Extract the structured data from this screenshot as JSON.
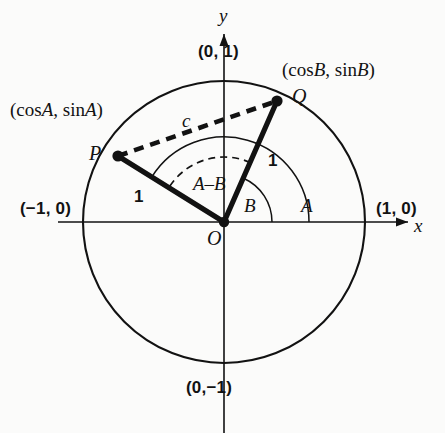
{
  "figure": {
    "background_color": "#fbfbfa",
    "ink_color": "#121212"
  },
  "axes": {
    "x_name": "x",
    "y_name": "y",
    "right_label": "(1, 0)",
    "left_label": "(−1, 0)",
    "top_label": "(0, 1)",
    "bottom_label": "(0,−1)"
  },
  "points": {
    "origin_label": "O",
    "p_label": "P",
    "q_label": "Q",
    "p_coords_label_prefix": "(cos",
    "p_coords_var": "A",
    "q_coords_var": "B",
    "p_coords_label": "(cosA, sinA)",
    "q_coords_label": "(cosB, sinB)"
  },
  "segments": {
    "op_length": "1",
    "oq_length": "1",
    "chord_label": "c"
  },
  "angles": {
    "a_label": "A",
    "b_label": "B",
    "difference_label": "A–B"
  },
  "chart_data": {
    "type": "scatter",
    "xlabel": "x",
    "ylabel": "y",
    "xlim": [
      -1.6,
      1.6
    ],
    "ylim": [
      -1.6,
      1.6
    ],
    "grid": false,
    "legend": "none",
    "circle": {
      "center": [
        0,
        0
      ],
      "radius": 1,
      "center_px": [
        224,
        222
      ],
      "radius_px": 141
    },
    "points": [
      {
        "name": "O",
        "x": 0.0,
        "y": 0.0,
        "px": [
          224,
          222
        ]
      },
      {
        "name": "P",
        "x": -0.75,
        "y": 0.47,
        "px": [
          118,
          156
        ],
        "angle_deg": 148,
        "label": "(cosA, sinA)"
      },
      {
        "name": "Q",
        "x": 0.38,
        "y": 0.86,
        "px": [
          277,
          101
        ],
        "angle_deg": 66,
        "label": "(cosB, sinB)"
      }
    ],
    "segments": [
      {
        "name": "OP",
        "from": "O",
        "to": "P",
        "style": "solid-thick",
        "label": "1"
      },
      {
        "name": "OQ",
        "from": "O",
        "to": "Q",
        "style": "solid-thick",
        "label": "1"
      },
      {
        "name": "PQ",
        "from": "P",
        "to": "Q",
        "style": "dashed-thick",
        "label": "c"
      }
    ],
    "arcs": [
      {
        "name": "angle-A",
        "from_deg": 0,
        "to_deg": 148,
        "radius_px": 85,
        "style": "solid-thin",
        "label": "A"
      },
      {
        "name": "angle-B",
        "from_deg": 0,
        "to_deg": 66,
        "radius_px": 48,
        "style": "solid-thin",
        "label": "B"
      },
      {
        "name": "angle-A-minus-B",
        "from_deg": 66,
        "to_deg": 148,
        "radius_px": 65,
        "style": "dashed-thin",
        "label": "A–B"
      }
    ]
  }
}
